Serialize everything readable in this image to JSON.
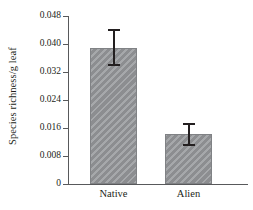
{
  "chart_data": {
    "type": "bar",
    "title": "",
    "xlabel": "",
    "ylabel": "Species richness/g leaf",
    "categories": [
      "Native",
      "Alien"
    ],
    "values": [
      0.0389,
      0.0143
    ],
    "errors_upper": [
      0.0443,
      0.0175
    ],
    "errors_lower": [
      0.0337,
      0.0108
    ],
    "ylim": [
      0,
      0.048
    ],
    "yticks": [
      0,
      0.008,
      0.016,
      0.024,
      0.032,
      0.04,
      0.048
    ],
    "ytick_labels": [
      "0",
      "0.008",
      "0.016",
      "0.024",
      "0.032",
      "0.040",
      "0.048"
    ],
    "grid": false,
    "legend": null,
    "bar_color": "#939598",
    "bar_edge_color": "#808285",
    "error_color": "#231f20",
    "axis_color": "#58595b",
    "text_color": "#231f20",
    "bar_fill_pattern": "diagonal-hatch"
  }
}
